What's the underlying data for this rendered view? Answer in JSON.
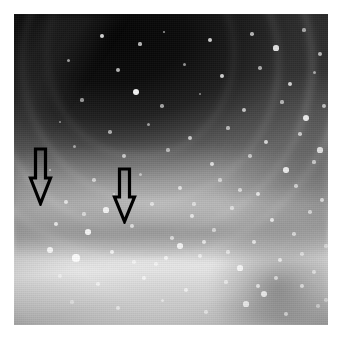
{
  "figure": {
    "kind": "endoscopic-photograph",
    "modality": "colonoscopy",
    "color_mode": "grayscale",
    "caption": "",
    "width_px": 341,
    "height_px": 340,
    "background_color": "#ffffff"
  },
  "photo": {
    "left_px": 14,
    "top_px": 14,
    "width_px": 314,
    "height_px": 311,
    "description": "Grayscale endoscopic view of a bowel lumen: dark concentric mucosal folds receding into the lumen at upper left, a broad transverse fold across the middle, and a brightly illuminated mucosal surface with specular highlights across the lower half.",
    "regions": [
      {
        "name": "lumen-dark-region",
        "position": "upper-left",
        "tone": "#0b0b0b"
      },
      {
        "name": "concentric-folds",
        "position": "upper",
        "tone": "#4a4a4a"
      },
      {
        "name": "transverse-fold-ridge",
        "position": "middle-band",
        "tone": "#9a9a9a"
      },
      {
        "name": "illuminated-mucosa",
        "position": "lower",
        "tone": "#ededed"
      },
      {
        "name": "nodular-structure",
        "position": "lower-right",
        "tone": "#8c8c8c"
      },
      {
        "name": "shadow-band",
        "position": "lower-left",
        "tone": "#4f4f4f"
      }
    ]
  },
  "annotations": {
    "arrow_color": "#000000",
    "arrow_fill": "none",
    "items": [
      {
        "name": "arrow-marker-left",
        "label": "",
        "direction": "down",
        "x_px": 28,
        "y_px": 147,
        "width_px": 25,
        "height_px": 59,
        "tip_x_px": 40,
        "tip_y_px": 206,
        "points_at": "transverse-fold-ridge"
      },
      {
        "name": "arrow-marker-right",
        "label": "",
        "direction": "down",
        "x_px": 112,
        "y_px": 167,
        "width_px": 25,
        "height_px": 57,
        "tip_x_px": 124,
        "tip_y_px": 224,
        "points_at": "transverse-fold-ridge"
      }
    ]
  },
  "speckles": {
    "color": "#ffffff",
    "count": 96,
    "points": [
      [
        88,
        22,
        2.0,
        0.85
      ],
      [
        126,
        30,
        1.6,
        0.7
      ],
      [
        150,
        18,
        1.4,
        0.6
      ],
      [
        196,
        26,
        2.2,
        0.8
      ],
      [
        238,
        20,
        1.8,
        0.7
      ],
      [
        262,
        34,
        2.6,
        0.9
      ],
      [
        290,
        16,
        1.6,
        0.65
      ],
      [
        306,
        40,
        2.0,
        0.75
      ],
      [
        54,
        46,
        1.5,
        0.6
      ],
      [
        104,
        56,
        2.0,
        0.7
      ],
      [
        170,
        50,
        1.5,
        0.55
      ],
      [
        208,
        62,
        2.4,
        0.8
      ],
      [
        246,
        54,
        1.7,
        0.6
      ],
      [
        276,
        70,
        2.2,
        0.8
      ],
      [
        300,
        58,
        1.5,
        0.6
      ],
      [
        122,
        78,
        3.2,
        0.95
      ],
      [
        68,
        86,
        1.6,
        0.55
      ],
      [
        148,
        92,
        1.8,
        0.6
      ],
      [
        186,
        80,
        1.4,
        0.5
      ],
      [
        230,
        96,
        2.0,
        0.7
      ],
      [
        268,
        88,
        1.6,
        0.6
      ],
      [
        292,
        104,
        3.4,
        0.9
      ],
      [
        310,
        92,
        2.0,
        0.7
      ],
      [
        46,
        108,
        1.4,
        0.5
      ],
      [
        96,
        118,
        1.8,
        0.6
      ],
      [
        134,
        110,
        1.5,
        0.55
      ],
      [
        176,
        124,
        2.0,
        0.7
      ],
      [
        214,
        114,
        1.6,
        0.6
      ],
      [
        252,
        128,
        2.2,
        0.75
      ],
      [
        286,
        120,
        1.8,
        0.65
      ],
      [
        306,
        136,
        2.6,
        0.8
      ],
      [
        60,
        132,
        1.5,
        0.5
      ],
      [
        110,
        142,
        2.0,
        0.65
      ],
      [
        154,
        136,
        1.6,
        0.55
      ],
      [
        198,
        150,
        2.4,
        0.75
      ],
      [
        236,
        142,
        1.8,
        0.6
      ],
      [
        272,
        156,
        2.8,
        0.85
      ],
      [
        300,
        148,
        1.6,
        0.6
      ],
      [
        36,
        156,
        1.4,
        0.5
      ],
      [
        80,
        166,
        1.8,
        0.6
      ],
      [
        126,
        160,
        1.5,
        0.5
      ],
      [
        166,
        174,
        2.2,
        0.7
      ],
      [
        206,
        166,
        1.6,
        0.55
      ],
      [
        244,
        180,
        2.4,
        0.75
      ],
      [
        282,
        172,
        1.8,
        0.6
      ],
      [
        308,
        186,
        2.0,
        0.7
      ],
      [
        52,
        188,
        2.0,
        0.7
      ],
      [
        92,
        196,
        2.6,
        0.85
      ],
      [
        138,
        190,
        1.8,
        0.6
      ],
      [
        178,
        202,
        2.2,
        0.7
      ],
      [
        218,
        194,
        1.6,
        0.55
      ],
      [
        258,
        206,
        2.4,
        0.75
      ],
      [
        296,
        198,
        1.8,
        0.6
      ],
      [
        42,
        210,
        2.2,
        0.75
      ],
      [
        74,
        218,
        2.8,
        0.9
      ],
      [
        118,
        212,
        2.0,
        0.65
      ],
      [
        158,
        224,
        1.8,
        0.6
      ],
      [
        200,
        216,
        1.6,
        0.55
      ],
      [
        240,
        228,
        2.2,
        0.7
      ],
      [
        280,
        220,
        1.8,
        0.6
      ],
      [
        312,
        232,
        1.6,
        0.55
      ],
      [
        36,
        236,
        3.0,
        0.9
      ],
      [
        62,
        244,
        3.6,
        0.95
      ],
      [
        98,
        238,
        2.4,
        0.8
      ],
      [
        142,
        250,
        1.8,
        0.6
      ],
      [
        186,
        242,
        2.0,
        0.65
      ],
      [
        226,
        254,
        2.6,
        0.8
      ],
      [
        266,
        246,
        2.2,
        0.7
      ],
      [
        300,
        258,
        2.4,
        0.75
      ],
      [
        46,
        262,
        2.0,
        0.65
      ],
      [
        84,
        270,
        1.8,
        0.6
      ],
      [
        130,
        264,
        2.2,
        0.7
      ],
      [
        172,
        276,
        2.0,
        0.65
      ],
      [
        212,
        268,
        1.6,
        0.55
      ],
      [
        250,
        280,
        3.0,
        0.85
      ],
      [
        288,
        272,
        2.4,
        0.75
      ],
      [
        312,
        286,
        1.8,
        0.6
      ],
      [
        58,
        288,
        1.6,
        0.5
      ],
      [
        104,
        294,
        2.0,
        0.6
      ],
      [
        148,
        286,
        1.5,
        0.5
      ],
      [
        192,
        298,
        1.8,
        0.55
      ],
      [
        232,
        290,
        2.6,
        0.8
      ],
      [
        272,
        300,
        2.2,
        0.7
      ],
      [
        304,
        292,
        1.8,
        0.6
      ],
      [
        166,
        232,
        2.8,
        0.85
      ],
      [
        190,
        228,
        2.0,
        0.7
      ],
      [
        152,
        244,
        2.4,
        0.75
      ],
      [
        120,
        248,
        1.8,
        0.6
      ],
      [
        262,
        264,
        2.0,
        0.65
      ],
      [
        244,
        272,
        2.2,
        0.7
      ],
      [
        288,
        240,
        1.8,
        0.6
      ],
      [
        214,
        238,
        1.6,
        0.55
      ],
      [
        70,
        200,
        1.6,
        0.55
      ],
      [
        100,
        180,
        1.4,
        0.5
      ],
      [
        180,
        190,
        1.6,
        0.55
      ],
      [
        226,
        176,
        1.8,
        0.6
      ]
    ]
  }
}
